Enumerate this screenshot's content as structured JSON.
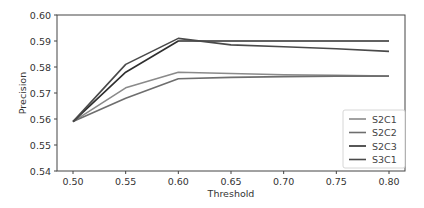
{
  "chart_data": {
    "type": "line",
    "title": "",
    "xlabel": "Threshold",
    "ylabel": "Precision",
    "x": [
      0.5,
      0.55,
      0.6,
      0.65,
      0.7,
      0.75,
      0.8
    ],
    "xlim": [
      0.485,
      0.815
    ],
    "ylim": [
      0.54,
      0.6
    ],
    "xticks": [
      "0.50",
      "0.55",
      "0.60",
      "0.65",
      "0.70",
      "0.75",
      "0.80"
    ],
    "yticks": [
      "0.54",
      "0.55",
      "0.56",
      "0.57",
      "0.58",
      "0.59",
      "0.60"
    ],
    "grid": false,
    "legend_position": "lower right",
    "series": [
      {
        "name": "S2C1",
        "color": "#8a8a8a",
        "values": [
          0.559,
          0.572,
          0.578,
          0.5775,
          0.577,
          0.5768,
          0.5765
        ]
      },
      {
        "name": "S2C2",
        "color": "#6e6e6e",
        "values": [
          0.559,
          0.568,
          0.5755,
          0.576,
          0.5763,
          0.5765,
          0.5765
        ]
      },
      {
        "name": "S2C3",
        "color": "#2e2e2e",
        "values": [
          0.559,
          0.578,
          0.59,
          0.59,
          0.59,
          0.59,
          0.59
        ]
      },
      {
        "name": "S3C1",
        "color": "#4a4a4a",
        "values": [
          0.559,
          0.581,
          0.591,
          0.5885,
          0.5878,
          0.587,
          0.586
        ]
      }
    ]
  }
}
